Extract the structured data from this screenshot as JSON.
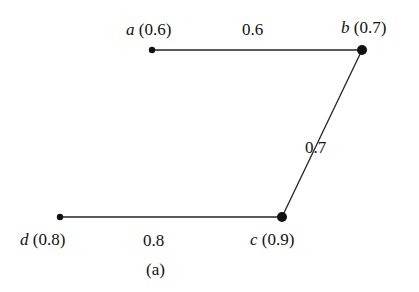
{
  "diagram": {
    "caption": "(a)",
    "nodes": [
      {
        "id": "a",
        "name": "a",
        "value": "(0.6)",
        "x": 152,
        "y": 50,
        "r": 3.2
      },
      {
        "id": "b",
        "name": "b",
        "value": "(0.7)",
        "x": 362,
        "y": 50,
        "r": 5
      },
      {
        "id": "c",
        "name": "c",
        "value": "(0.9)",
        "x": 282,
        "y": 217,
        "r": 5
      },
      {
        "id": "d",
        "name": "d",
        "value": "(0.8)",
        "x": 60,
        "y": 217,
        "r": 3.2
      }
    ],
    "edges": [
      {
        "from": "a",
        "to": "b",
        "weight": "0.6"
      },
      {
        "from": "b",
        "to": "c",
        "weight": "0.7"
      },
      {
        "from": "c",
        "to": "d",
        "weight": "0.8"
      }
    ]
  }
}
